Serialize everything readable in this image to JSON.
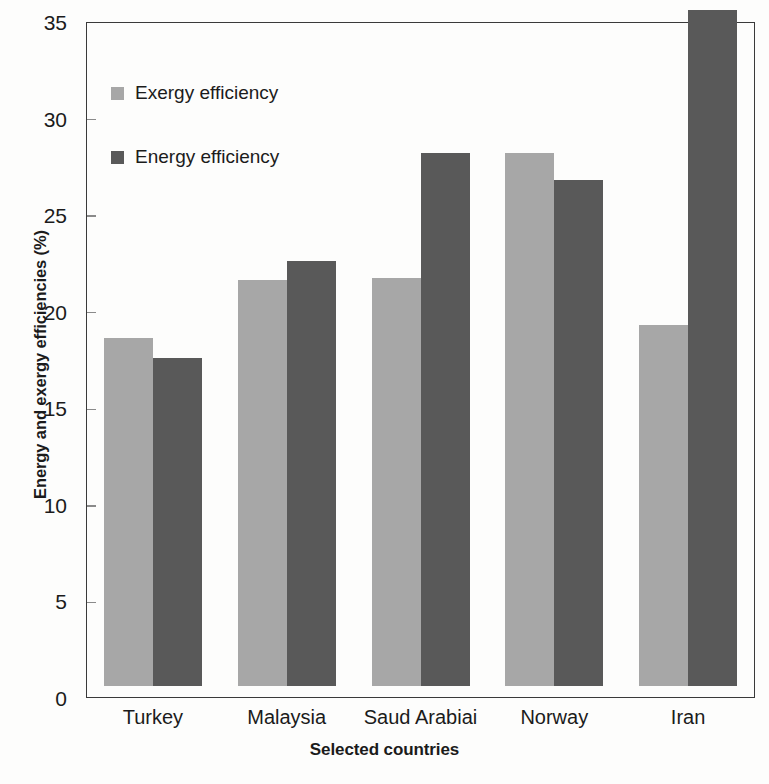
{
  "chart_data": {
    "type": "bar",
    "title": "",
    "subtitle": "",
    "xlabel": "Selected countries",
    "ylabel": "Energy and exergy efficiencies (%)",
    "categories": [
      "Turkey",
      "Malaysia",
      "Saud Arabiai",
      "Norway",
      "Iran"
    ],
    "series": [
      {
        "name": "Exergy efficiency",
        "color": "#a7a7a7",
        "values": [
          18.0,
          21.0,
          21.1,
          27.6,
          18.7
        ]
      },
      {
        "name": "Energy efficiency",
        "color": "#595959",
        "values": [
          17.0,
          22.0,
          27.6,
          26.2,
          35.3
        ]
      }
    ],
    "ylim": [
      0,
      35
    ],
    "ytick_values": [
      0,
      5,
      10,
      15,
      20,
      25,
      30,
      35
    ],
    "ytick_labels": [
      "0",
      "5",
      "10",
      "15",
      "20",
      "25",
      "30",
      "35"
    ],
    "grid": false,
    "legend_position": "upper-left-inside"
  },
  "legend": {
    "items": [
      {
        "label": "Exergy efficiency",
        "swatch": "#a7a7a7"
      },
      {
        "label": "Energy efficiency",
        "swatch": "#595959"
      }
    ]
  },
  "axes": {
    "y_title": "Energy and exergy efficiencies (%)",
    "x_title": "Selected countries"
  }
}
